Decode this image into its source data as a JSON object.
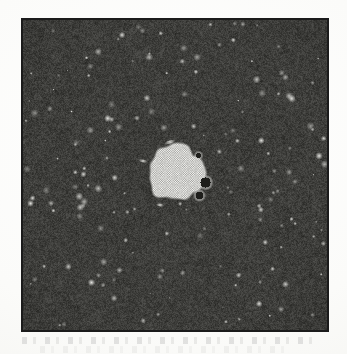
{
  "figure": {
    "domain_label": "electron-micrograph",
    "caption": "",
    "width": 347,
    "height": 354,
    "background_color": "#fdfdfb"
  },
  "panel": {
    "name": "micrograph-panel",
    "x": 21,
    "y": 18,
    "width": 308,
    "height": 314,
    "border_color": "#1b1b1b",
    "border_width": 2,
    "matrix_label": "amorphous-matrix",
    "matrix_base_color": "#4a4a48",
    "matrix_dark_color": "#303030",
    "matrix_light_color": "#6e6e6a",
    "speckle_color": "#e8e8e4",
    "speckle_count": 170,
    "noise_grain_scale": 1.6
  },
  "cluster": {
    "name": "crystalline-nucleus",
    "center_x": 176,
    "center_y": 172,
    "radius_px": 28,
    "lattice_type": "square",
    "lattice_spacing_px": 2.3,
    "lattice_bright_color": "#e6e6e2",
    "lattice_mid_color": "#c8c8c4",
    "lattice_dark_color": "#9a9a96",
    "edge_roughness": 0.16,
    "rotation_deg": 0
  },
  "voids": [
    {
      "name": "void-right",
      "cx": 205,
      "cy": 182,
      "r": 6.5
    },
    {
      "name": "void-lower-right",
      "cx": 199,
      "cy": 195,
      "r": 5.0
    },
    {
      "name": "void-upper-right",
      "cx": 198,
      "cy": 155,
      "r": 3.4
    }
  ],
  "flakes": [
    {
      "name": "flake-above-cluster",
      "x": 170,
      "y": 142,
      "w": 12,
      "h": 3,
      "angle": -18
    },
    {
      "name": "flake-left-cluster",
      "x": 143,
      "y": 161,
      "w": 9,
      "h": 2.5,
      "angle": 12
    },
    {
      "name": "flake-below-cluster",
      "x": 160,
      "y": 205,
      "w": 8,
      "h": 2.5,
      "angle": 8
    }
  ],
  "scan_artifacts": {
    "ghost_strip_1_label": "scan-ghost-strip",
    "ghost_strip_2_label": "scan-ghost-strip"
  },
  "chart_data": {
    "type": "heatmap",
    "title": "",
    "xlabel": "",
    "ylabel": "",
    "field_width_px": 308,
    "field_height_px": 314,
    "intensity_range": [
      0,
      255
    ],
    "matrix_mean_intensity": 74,
    "matrix_std_intensity": 22,
    "nucleus_mean_intensity": 205,
    "nucleus_diameter_px": 56,
    "nucleus_area_fraction": 0.026,
    "lattice_fringe_spacing_px": 2.3,
    "grid": false,
    "legend": "none"
  }
}
